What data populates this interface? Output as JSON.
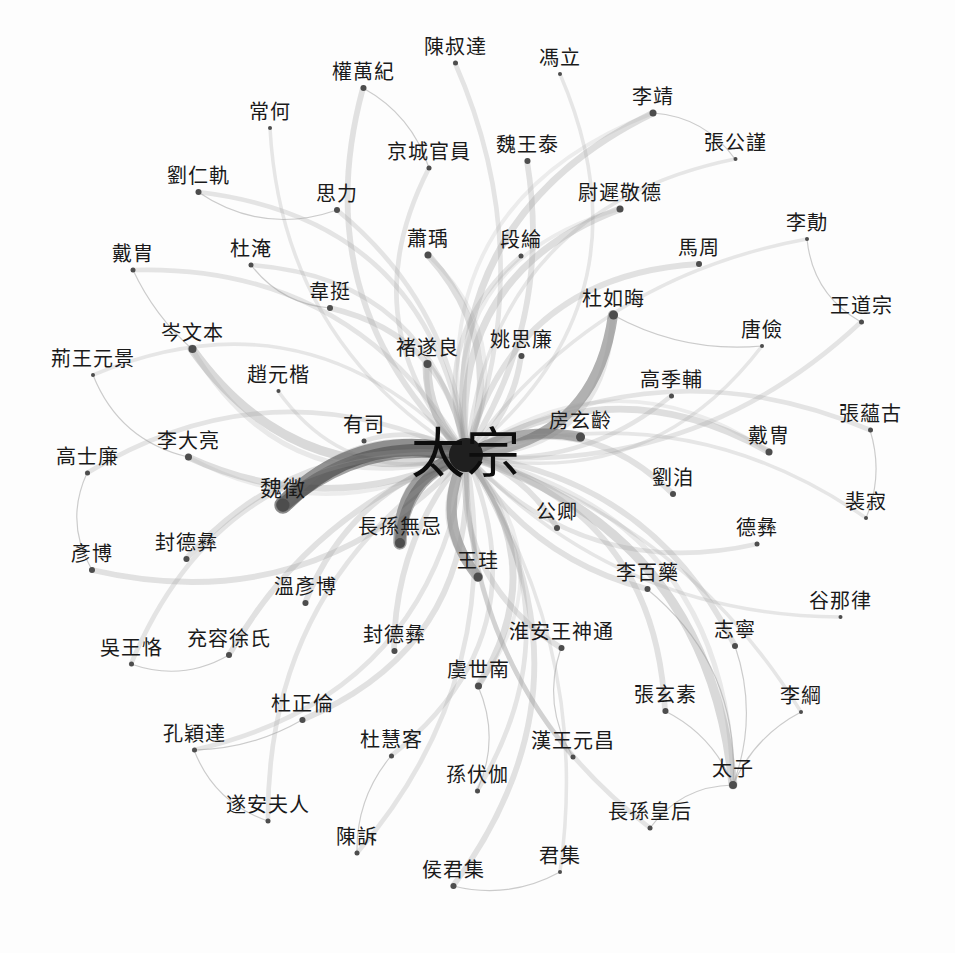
{
  "graph": {
    "type": "network",
    "title": "太宗 ego-network",
    "background_color": "#fdfdfd",
    "node_color": "#4d4d4d",
    "label_color": "#1a1a1a",
    "edge_color_dark": "#3a3a3a",
    "edge_color_light": "#9a9a9a",
    "hub": "太宗",
    "node_count": 62,
    "nodes": [
      {
        "id": "hub",
        "label": "太宗",
        "x": 466,
        "y": 455,
        "size": 34,
        "font": 54,
        "dx": 0,
        "dy": 0,
        "weight": 100
      },
      {
        "label": "陳叔達",
        "x": 455,
        "y": 63,
        "size": 5,
        "font": 20,
        "dx": 0,
        "dy": -16,
        "weight": 4
      },
      {
        "label": "馮立",
        "x": 560,
        "y": 74,
        "size": 4,
        "font": 20,
        "dx": 0,
        "dy": -16,
        "weight": 3
      },
      {
        "label": "權萬紀",
        "x": 363,
        "y": 88,
        "size": 6,
        "font": 20,
        "dx": 0,
        "dy": -16,
        "weight": 5
      },
      {
        "label": "李靖",
        "x": 653,
        "y": 113,
        "size": 7,
        "font": 20,
        "dx": 0,
        "dy": -16,
        "weight": 6
      },
      {
        "label": "常何",
        "x": 270,
        "y": 128,
        "size": 4,
        "font": 20,
        "dx": 0,
        "dy": -16,
        "weight": 3
      },
      {
        "label": "京城官員",
        "x": 429,
        "y": 168,
        "size": 5,
        "font": 20,
        "dx": 0,
        "dy": -16,
        "weight": 4
      },
      {
        "label": "魏王泰",
        "x": 527,
        "y": 161,
        "size": 6,
        "font": 20,
        "dx": 0,
        "dy": -16,
        "weight": 5
      },
      {
        "label": "張公謹",
        "x": 735,
        "y": 159,
        "size": 4,
        "font": 20,
        "dx": 0,
        "dy": -16,
        "weight": 3
      },
      {
        "label": "劉仁軌",
        "x": 198,
        "y": 192,
        "size": 6,
        "font": 20,
        "dx": 0,
        "dy": -16,
        "weight": 4
      },
      {
        "label": "思力",
        "x": 337,
        "y": 210,
        "size": 6,
        "font": 20,
        "dx": 0,
        "dy": -16,
        "weight": 4
      },
      {
        "label": "尉遲敬德",
        "x": 620,
        "y": 209,
        "size": 7,
        "font": 20,
        "dx": 0,
        "dy": -16,
        "weight": 6
      },
      {
        "label": "李勣",
        "x": 807,
        "y": 239,
        "size": 4,
        "font": 20,
        "dx": 0,
        "dy": -16,
        "weight": 3
      },
      {
        "label": "戴胄",
        "x": 133,
        "y": 270,
        "size": 5,
        "font": 20,
        "dx": 0,
        "dy": -16,
        "weight": 4
      },
      {
        "label": "杜淹",
        "x": 251,
        "y": 265,
        "size": 5,
        "font": 20,
        "dx": 0,
        "dy": -16,
        "weight": 4
      },
      {
        "label": "蕭瑀",
        "x": 428,
        "y": 255,
        "size": 7,
        "font": 20,
        "dx": 0,
        "dy": -16,
        "weight": 6
      },
      {
        "label": "段綸",
        "x": 521,
        "y": 256,
        "size": 5,
        "font": 20,
        "dx": 0,
        "dy": -16,
        "weight": 4
      },
      {
        "label": "馬周",
        "x": 699,
        "y": 264,
        "size": 6,
        "font": 20,
        "dx": 0,
        "dy": -16,
        "weight": 5
      },
      {
        "label": "韋挺",
        "x": 330,
        "y": 308,
        "size": 6,
        "font": 20,
        "dx": 0,
        "dy": -16,
        "weight": 5
      },
      {
        "label": "杜如晦",
        "x": 613,
        "y": 315,
        "size": 9,
        "font": 20,
        "dx": 0,
        "dy": -16,
        "weight": 9
      },
      {
        "label": "王道宗",
        "x": 861,
        "y": 322,
        "size": 5,
        "font": 20,
        "dx": 0,
        "dy": -16,
        "weight": 4
      },
      {
        "label": "岑文本",
        "x": 192,
        "y": 349,
        "size": 8,
        "font": 20,
        "dx": 0,
        "dy": -16,
        "weight": 8
      },
      {
        "label": "褚遂良",
        "x": 427,
        "y": 364,
        "size": 8,
        "font": 20,
        "dx": 0,
        "dy": -16,
        "weight": 8
      },
      {
        "label": "姚思廉",
        "x": 521,
        "y": 356,
        "size": 6,
        "font": 20,
        "dx": 0,
        "dy": -16,
        "weight": 5
      },
      {
        "label": "唐儉",
        "x": 762,
        "y": 346,
        "size": 4,
        "font": 20,
        "dx": 0,
        "dy": -16,
        "weight": 3
      },
      {
        "label": "荊王元景",
        "x": 93,
        "y": 375,
        "size": 4,
        "font": 20,
        "dx": 0,
        "dy": -16,
        "weight": 3
      },
      {
        "label": "趙元楷",
        "x": 278,
        "y": 391,
        "size": 4,
        "font": 20,
        "dx": 0,
        "dy": -16,
        "weight": 3
      },
      {
        "label": "高季輔",
        "x": 671,
        "y": 396,
        "size": 5,
        "font": 20,
        "dx": 0,
        "dy": -16,
        "weight": 4
      },
      {
        "label": "張蘊古",
        "x": 870,
        "y": 430,
        "size": 5,
        "font": 20,
        "dx": 0,
        "dy": -16,
        "weight": 4
      },
      {
        "label": "有司",
        "x": 364,
        "y": 441,
        "size": 5,
        "font": 20,
        "dx": 0,
        "dy": -16,
        "weight": 4
      },
      {
        "label": "房玄齡",
        "x": 580,
        "y": 437,
        "size": 9,
        "font": 20,
        "dx": 0,
        "dy": -16,
        "weight": 9
      },
      {
        "label": "李大亮",
        "x": 188,
        "y": 457,
        "size": 7,
        "font": 20,
        "dx": 0,
        "dy": -16,
        "weight": 6
      },
      {
        "label": "戴冑",
        "x": 769,
        "y": 452,
        "size": 7,
        "font": 20,
        "dx": 0,
        "dy": -16,
        "weight": 6
      },
      {
        "label": "高士廉",
        "x": 87,
        "y": 473,
        "size": 5,
        "font": 20,
        "dx": 0,
        "dy": -16,
        "weight": 4
      },
      {
        "label": "魏徵",
        "x": 283,
        "y": 505,
        "size": 13,
        "font": 22,
        "dx": 0,
        "dy": -16,
        "weight": 16
      },
      {
        "label": "劉洎",
        "x": 673,
        "y": 494,
        "size": 6,
        "font": 20,
        "dx": 0,
        "dy": -16,
        "weight": 5
      },
      {
        "label": "裴寂",
        "x": 866,
        "y": 518,
        "size": 4,
        "font": 20,
        "dx": 0,
        "dy": -16,
        "weight": 3
      },
      {
        "label": "長孫無忌",
        "x": 400,
        "y": 543,
        "size": 10,
        "font": 20,
        "dx": 0,
        "dy": -16,
        "weight": 12
      },
      {
        "label": "公卿",
        "x": 557,
        "y": 528,
        "size": 6,
        "font": 20,
        "dx": 0,
        "dy": -16,
        "weight": 5
      },
      {
        "label": "德彝",
        "x": 757,
        "y": 544,
        "size": 5,
        "font": 20,
        "dx": 0,
        "dy": -16,
        "weight": 4
      },
      {
        "label": "封德彝",
        "x": 186,
        "y": 559,
        "size": 6,
        "font": 20,
        "dx": 0,
        "dy": -16,
        "weight": 5
      },
      {
        "label": "彥博",
        "x": 92,
        "y": 570,
        "size": 6,
        "font": 20,
        "dx": 0,
        "dy": -16,
        "weight": 5
      },
      {
        "label": "王珪",
        "x": 478,
        "y": 577,
        "size": 9,
        "font": 20,
        "dx": 0,
        "dy": -16,
        "weight": 9
      },
      {
        "label": "李百藥",
        "x": 647,
        "y": 589,
        "size": 6,
        "font": 20,
        "dx": 0,
        "dy": -16,
        "weight": 5
      },
      {
        "label": "溫彥博",
        "x": 305,
        "y": 603,
        "size": 6,
        "font": 20,
        "dx": 0,
        "dy": -16,
        "weight": 5
      },
      {
        "label": "谷那律",
        "x": 840,
        "y": 617,
        "size": 4,
        "font": 20,
        "dx": 0,
        "dy": -16,
        "weight": 3
      },
      {
        "label": "充容徐氏",
        "x": 229,
        "y": 655,
        "size": 6,
        "font": 20,
        "dx": 0,
        "dy": -16,
        "weight": 5
      },
      {
        "label": "封德彝",
        "x": 394,
        "y": 651,
        "size": 6,
        "font": 20,
        "dx": 0,
        "dy": -16,
        "weight": 5
      },
      {
        "label": "淮安王神通",
        "x": 561,
        "y": 648,
        "size": 6,
        "font": 20,
        "dx": 0,
        "dy": -16,
        "weight": 5
      },
      {
        "label": "志寧",
        "x": 735,
        "y": 646,
        "size": 6,
        "font": 20,
        "dx": 0,
        "dy": -16,
        "weight": 5
      },
      {
        "label": "吳王恪",
        "x": 131,
        "y": 664,
        "size": 5,
        "font": 20,
        "dx": 0,
        "dy": -16,
        "weight": 4
      },
      {
        "label": "虞世南",
        "x": 478,
        "y": 686,
        "size": 7,
        "font": 20,
        "dx": 0,
        "dy": -16,
        "weight": 6
      },
      {
        "label": "張玄素",
        "x": 665,
        "y": 711,
        "size": 6,
        "font": 20,
        "dx": 0,
        "dy": -16,
        "weight": 5
      },
      {
        "label": "李綱",
        "x": 801,
        "y": 712,
        "size": 4,
        "font": 20,
        "dx": 0,
        "dy": -16,
        "weight": 3
      },
      {
        "label": "杜正倫",
        "x": 302,
        "y": 720,
        "size": 6,
        "font": 20,
        "dx": 0,
        "dy": -16,
        "weight": 5
      },
      {
        "label": "杜慧客",
        "x": 391,
        "y": 756,
        "size": 5,
        "font": 20,
        "dx": 0,
        "dy": -16,
        "weight": 4
      },
      {
        "label": "漢王元昌",
        "x": 573,
        "y": 757,
        "size": 5,
        "font": 20,
        "dx": 0,
        "dy": -16,
        "weight": 4
      },
      {
        "label": "孔穎達",
        "x": 194,
        "y": 750,
        "size": 5,
        "font": 20,
        "dx": 0,
        "dy": -16,
        "weight": 4
      },
      {
        "label": "孫伏伽",
        "x": 477,
        "y": 791,
        "size": 5,
        "font": 20,
        "dx": 0,
        "dy": -16,
        "weight": 4
      },
      {
        "label": "太子",
        "x": 733,
        "y": 785,
        "size": 8,
        "font": 20,
        "dx": 0,
        "dy": -16,
        "weight": 8
      },
      {
        "label": "遂安夫人",
        "x": 268,
        "y": 821,
        "size": 5,
        "font": 20,
        "dx": 0,
        "dy": -16,
        "weight": 4
      },
      {
        "label": "長孫皇后",
        "x": 650,
        "y": 828,
        "size": 5,
        "font": 20,
        "dx": 0,
        "dy": -16,
        "weight": 4
      },
      {
        "label": "陳訴",
        "x": 357,
        "y": 853,
        "size": 5,
        "font": 20,
        "dx": 0,
        "dy": -16,
        "weight": 4
      },
      {
        "label": "侯君集",
        "x": 453,
        "y": 886,
        "size": 6,
        "font": 20,
        "dx": 0,
        "dy": -16,
        "weight": 5
      },
      {
        "label": "君集",
        "x": 560,
        "y": 872,
        "size": 4,
        "font": 20,
        "dx": 0,
        "dy": -16,
        "weight": 3
      }
    ],
    "secondary_edges": [
      {
        "from": "權萬紀",
        "to": "京城官員"
      },
      {
        "from": "李靖",
        "to": "張公謹"
      },
      {
        "from": "劉仁軌",
        "to": "思力"
      },
      {
        "from": "荊王元景",
        "to": "李大亮"
      },
      {
        "from": "高士廉",
        "to": "彥博"
      },
      {
        "from": "吳王恪",
        "to": "充容徐氏"
      },
      {
        "from": "孔穎達",
        "to": "遂安夫人"
      },
      {
        "from": "孔穎達",
        "to": "杜正倫"
      },
      {
        "from": "侯君集",
        "to": "君集"
      },
      {
        "from": "太子",
        "to": "長孫皇后"
      },
      {
        "from": "太子",
        "to": "李綱"
      },
      {
        "from": "太子",
        "to": "張玄素"
      },
      {
        "from": "太子",
        "to": "志寧"
      },
      {
        "from": "太子",
        "to": "李百藥"
      },
      {
        "from": "李勣",
        "to": "王道宗"
      },
      {
        "from": "張蘊古",
        "to": "裴寂"
      },
      {
        "from": "杜慧客",
        "to": "陳訴"
      },
      {
        "from": "戴胄",
        "to": "岑文本"
      },
      {
        "from": "杜淹",
        "to": "韋挺"
      },
      {
        "from": "唐儉",
        "to": "杜如晦"
      },
      {
        "from": "淮安王神通",
        "to": "漢王元昌"
      },
      {
        "from": "虞世南",
        "to": "孫伏伽"
      }
    ]
  }
}
